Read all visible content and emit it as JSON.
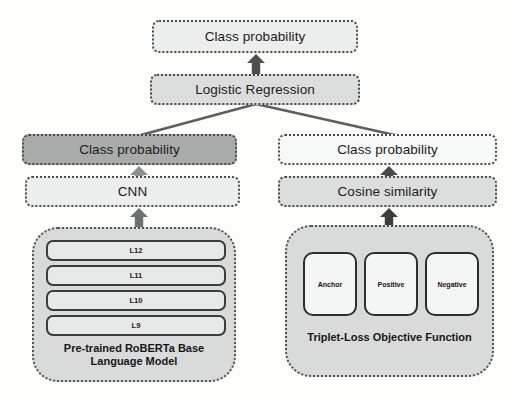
{
  "diagram": {
    "nodes": {
      "top_class_probability": "Class probability",
      "logistic_regression": "Logistic Regression",
      "left_class_probability": "Class probability",
      "right_class_probability": "Class probability",
      "cnn": "CNN",
      "cosine_similarity": "Cosine similarity"
    },
    "left_branch": {
      "caption_line1": "Pre-trained RoBERTa Base",
      "caption_line2": "Language Model",
      "layers": [
        {
          "label": "L12"
        },
        {
          "label": "L11"
        },
        {
          "label": "L10"
        },
        {
          "label": "L9"
        }
      ]
    },
    "right_branch": {
      "caption": "Triplet-Loss Objective Function",
      "chips": [
        {
          "label": "Anchor"
        },
        {
          "label": "Positive"
        },
        {
          "label": "Negative"
        }
      ]
    },
    "icons": {
      "arrow_up": "arrow-up-icon"
    },
    "colors": {
      "background": "#fdfdfc",
      "box_border": "#4a4a4a",
      "fill_light": "#eceded",
      "fill_mid": "#dcdddd",
      "fill_dark": "#a9abab",
      "group_fill": "#d9dada",
      "arrow": "#4f4f4f",
      "connector_line": "#5a5a5a",
      "text": "#1b1b1b"
    }
  }
}
